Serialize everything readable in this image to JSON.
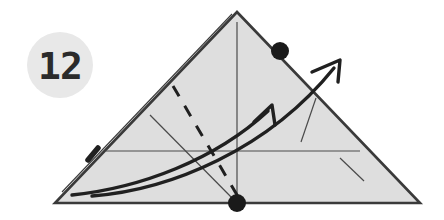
{
  "figure": {
    "background_color": "#ffffff",
    "badge": {
      "label": "12",
      "circle_fill": "#e8e8e8",
      "text_color": "#2b2b2b",
      "center_x": 60,
      "center_y": 65,
      "radius": 33
    },
    "triangle": {
      "name": "shaded-triangle",
      "fill": "#dedede",
      "stroke": "#3a3a3a",
      "stroke_width": 2.6,
      "apex": [
        237,
        12
      ],
      "bottom_left": [
        55,
        203
      ],
      "bottom_right": [
        420,
        203
      ]
    },
    "edge_highlight": {
      "name": "left-edge-double-line",
      "stroke": "#3a3a3a",
      "stroke_width": 1.1,
      "from": [
        232,
        14
      ],
      "to": [
        62,
        192
      ]
    },
    "edge_tick": {
      "name": "left-edge-tick-mark",
      "stroke": "#202020",
      "stroke_width": 5.5,
      "from": [
        98,
        148
      ],
      "to": [
        88,
        160
      ]
    },
    "vertical_axis": {
      "name": "vertical-axis-line",
      "stroke": "#4a4a4a",
      "stroke_width": 1.2,
      "from": [
        237,
        22
      ],
      "to": [
        237,
        203
      ]
    },
    "horizontal_axis": {
      "name": "horizontal-axis-line",
      "stroke": "#4a4a4a",
      "stroke_width": 1.2,
      "from": [
        106,
        151
      ],
      "to": [
        360,
        151
      ]
    },
    "thin_diagonal": {
      "name": "thin-diagonal-line",
      "stroke": "#4a4a4a",
      "stroke_width": 1.2,
      "from": [
        150,
        115
      ],
      "to": [
        237,
        203
      ]
    },
    "dashed_diagonal": {
      "name": "dashed-diagonal-line",
      "stroke": "#202020",
      "stroke_width": 3.0,
      "dash_pattern": "12 11",
      "from": [
        173,
        86
      ],
      "to": [
        240,
        200
      ]
    },
    "thin_right_upper": {
      "name": "thin-right-upper-line",
      "stroke": "#4a4a4a",
      "stroke_width": 1.2,
      "from": [
        301,
        142
      ],
      "to": [
        316,
        98
      ]
    },
    "thin_right_lower": {
      "name": "thin-right-lower-line",
      "stroke": "#4a4a4a",
      "stroke_width": 1.2,
      "from": [
        340,
        158
      ],
      "to": [
        364,
        181
      ]
    },
    "curve_inner": {
      "name": "inner-curved-vector",
      "stroke": "#202020",
      "stroke_width": 3.4,
      "path": "M 72 195 C 140 188 215 160 268 111",
      "arrow_tip": [
        272,
        105
      ],
      "arrow_left": [
        254,
        122
      ],
      "arrow_right": [
        275,
        125
      ]
    },
    "curve_outer": {
      "name": "outer-curved-vector",
      "stroke": "#202020",
      "stroke_width": 3.4,
      "path": "M 92 196 C 170 190 268 150 334 68",
      "arrow_tip": [
        340,
        60
      ],
      "arrow_left": [
        312,
        72
      ],
      "arrow_right": [
        338,
        82
      ]
    },
    "dot_edge": {
      "name": "upper-right-vertex-dot",
      "fill": "#1a1a1a",
      "cx": 280,
      "cy": 51,
      "r": 9
    },
    "dot_base": {
      "name": "base-vertex-dot",
      "fill": "#1a1a1a",
      "cx": 237,
      "cy": 203,
      "r": 9
    }
  }
}
